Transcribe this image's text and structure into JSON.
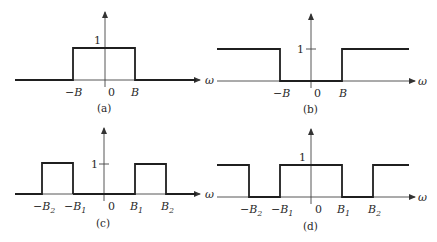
{
  "figure": {
    "panels": [
      {
        "id": "a",
        "caption": "(a)",
        "type": "lowpass",
        "gain_label": "1",
        "axis_label": "ω",
        "origin_label": "0",
        "ticks": [
          "−B",
          "B"
        ]
      },
      {
        "id": "b",
        "caption": "(b)",
        "type": "highpass",
        "gain_label": "1",
        "axis_label": "ω",
        "origin_label": "0",
        "ticks": [
          "−B",
          "B"
        ]
      },
      {
        "id": "c",
        "caption": "(c)",
        "type": "bandpass",
        "gain_label": "1",
        "axis_label": "ω",
        "origin_label": "0",
        "ticks": [
          "−B2",
          "−B1",
          "B1",
          "B2"
        ]
      },
      {
        "id": "d",
        "caption": "(d)",
        "type": "bandstop",
        "gain_label": "1",
        "axis_label": "ω",
        "origin_label": "0",
        "ticks": [
          "−B2",
          "−B1",
          "B1",
          "B2"
        ]
      }
    ]
  },
  "labels": {
    "a": {
      "one": "1",
      "omega": "ω",
      "zero": "0",
      "negB": "−B",
      "B": "B",
      "cap": "(a)"
    },
    "b": {
      "one": "1",
      "omega": "ω",
      "zero": "0",
      "negB": "−B",
      "B": "B",
      "cap": "(b)"
    },
    "c": {
      "one": "1",
      "omega": "ω",
      "zero": "0",
      "neg": "−",
      "B": "B",
      "s1": "1",
      "s2": "2",
      "cap": "(c)"
    },
    "d": {
      "one": "1",
      "omega": "ω",
      "zero": "0",
      "neg": "−",
      "B": "B",
      "s1": "1",
      "s2": "2",
      "cap": "(d)"
    }
  }
}
